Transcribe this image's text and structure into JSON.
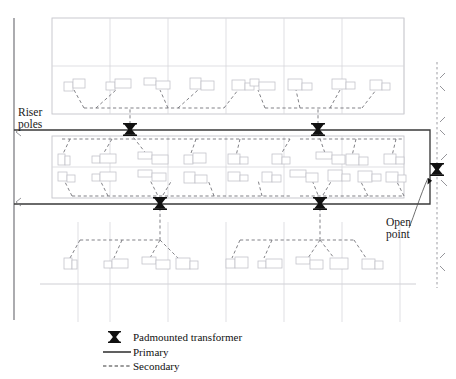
{
  "figure": {
    "kind": "electrical-distribution-plan"
  },
  "annotations": [
    {
      "id": "riser-poles",
      "text": "Riser\npoles",
      "line1": "Riser",
      "line2": "poles",
      "x": 18,
      "y": 116
    },
    {
      "id": "open-point",
      "text": "Open\npoint",
      "line1": "Open",
      "line2": "point",
      "x": 388,
      "y": 218
    }
  ],
  "legend": {
    "items": [
      {
        "id": "padmounted-transformer",
        "label": "Padmounted transformer",
        "symbol": "transformer-glyph"
      },
      {
        "id": "primary",
        "label": "Primary",
        "symbol": "solid-line"
      },
      {
        "id": "secondary",
        "label": "Secondary",
        "symbol": "dashed-line"
      }
    ]
  },
  "colors": {
    "primary_line": "#3a3a3a",
    "secondary_line": "#6b6b71",
    "street_grid": "#c9c9cf",
    "house_outline": "#c0c0c7",
    "transformer": "#111111",
    "background": "#ffffff"
  },
  "counts": {
    "padmounted_transformers_on_loop": 4,
    "open_point_transformers": 1,
    "riser_poles": 2
  },
  "geometry": {
    "feeder_line": {
      "x": 14,
      "y_top": 18,
      "y_bottom": 320
    },
    "primary_loop": {
      "x_left": 14,
      "x_right": 430,
      "y_top": 130,
      "y_bottom": 204
    },
    "open_point_line": {
      "x": 437,
      "y_top": 62,
      "y_bottom": 288
    },
    "transformers": [
      {
        "id": "t-top-left",
        "x": 130,
        "y": 130
      },
      {
        "id": "t-top-right",
        "x": 318,
        "y": 130
      },
      {
        "id": "t-bot-left",
        "x": 160,
        "y": 204
      },
      {
        "id": "t-bot-right",
        "x": 320,
        "y": 204
      },
      {
        "id": "t-open",
        "x": 437,
        "y": 170
      }
    ],
    "riser_poles": [
      {
        "id": "riser-top",
        "x": 14,
        "y": 130
      },
      {
        "id": "riser-bottom",
        "x": 14,
        "y": 204
      }
    ]
  }
}
